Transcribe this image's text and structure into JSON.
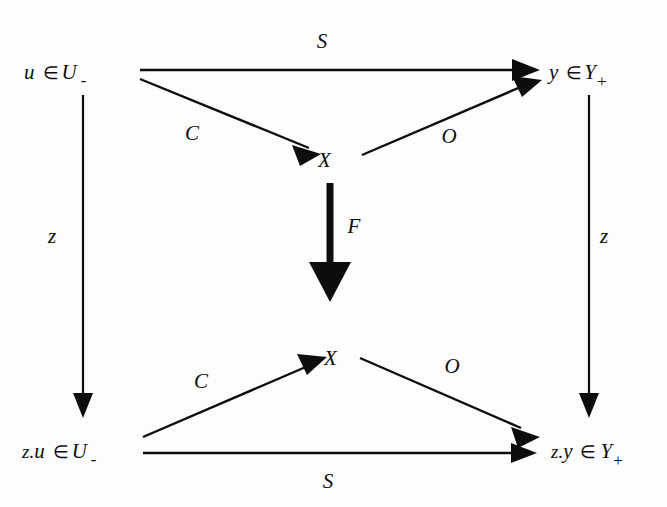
{
  "diagram": {
    "type": "commutative-diagram",
    "background_color": "#fdfdfd",
    "ink_color": "#0d0d0d",
    "nodes": [
      {
        "id": "top-left",
        "prefix": "",
        "variable": "u",
        "operator": "∈",
        "space": "U",
        "subscript": "-",
        "x": 78,
        "y": 72
      },
      {
        "id": "top-right",
        "prefix": "",
        "variable": "y",
        "operator": "∈",
        "space": "Y",
        "subscript": "+",
        "x": 580,
        "y": 72
      },
      {
        "id": "top-state",
        "prefix": "",
        "variable": "X",
        "operator": "",
        "space": "",
        "subscript": "",
        "x": 326,
        "y": 160
      },
      {
        "id": "bottom-state",
        "prefix": "",
        "variable": "X",
        "operator": "",
        "space": "",
        "subscript": "",
        "x": 332,
        "y": 358
      },
      {
        "id": "bottom-left",
        "prefix": "z.",
        "variable": "u",
        "operator": "∈",
        "space": "U",
        "subscript": "-",
        "x": 62,
        "y": 451
      },
      {
        "id": "bottom-right",
        "prefix": "z.",
        "variable": "y",
        "operator": "∈",
        "space": "Y",
        "subscript": "+",
        "x": 560,
        "y": 451
      }
    ],
    "edges": [
      {
        "id": "top-S",
        "label": "S",
        "from": "top-left",
        "to": "top-right",
        "style": "thin",
        "label_x": 330,
        "label_y": 48,
        "x1": 140,
        "y1": 70,
        "x2": 520,
        "y2": 70
      },
      {
        "id": "top-C",
        "label": "C",
        "from": "top-left",
        "to": "top-state",
        "style": "thin",
        "label_x": 194,
        "label_y": 135,
        "x1": 140,
        "y1": 79,
        "x2": 308,
        "y2": 148
      },
      {
        "id": "top-O",
        "label": "O",
        "from": "top-state",
        "to": "top-right",
        "style": "thin",
        "label_x": 449,
        "label_y": 138,
        "x1": 362,
        "y1": 155,
        "x2": 522,
        "y2": 86
      },
      {
        "id": "center-F",
        "label": "F",
        "from": "top-state",
        "to": "bottom-state",
        "style": "bold",
        "label_x": 350,
        "label_y": 228,
        "x1": 330,
        "y1": 183,
        "x2": 330,
        "y2": 300
      },
      {
        "id": "bottom-C",
        "label": "C",
        "from": "bottom-left",
        "to": "bottom-state",
        "style": "thin",
        "label_x": 203,
        "label_y": 383,
        "x1": 143,
        "y1": 437,
        "x2": 314,
        "y2": 363
      },
      {
        "id": "bottom-O",
        "label": "O",
        "from": "bottom-state",
        "to": "bottom-right",
        "style": "thin",
        "label_x": 452,
        "label_y": 368,
        "x1": 360,
        "y1": 358,
        "x2": 520,
        "y2": 428
      },
      {
        "id": "bottom-S",
        "label": "S",
        "from": "bottom-left",
        "to": "bottom-right",
        "style": "thin",
        "label_x": 330,
        "label_y": 483,
        "x1": 143,
        "y1": 453,
        "x2": 518,
        "y2": 453
      },
      {
        "id": "left-z",
        "label": "z",
        "from": "top-left",
        "to": "bottom-left",
        "style": "thin-vert",
        "label_x": 52,
        "label_y": 238,
        "x1": 83,
        "y1": 95,
        "x2": 83,
        "y2": 415
      },
      {
        "id": "right-z",
        "label": "z",
        "from": "top-right",
        "to": "bottom-right",
        "style": "thin-vert",
        "label_x": 601,
        "label_y": 238,
        "x1": 589,
        "y1": 95,
        "x2": 589,
        "y2": 415
      }
    ]
  }
}
